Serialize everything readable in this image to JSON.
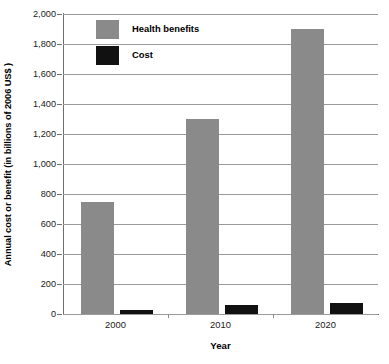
{
  "chart_data": {
    "type": "bar",
    "title": "",
    "xlabel": "Year",
    "ylabel": "Annual cost or benefit (in billions of 2006 US$ )",
    "categories": [
      "2000",
      "2010",
      "2020"
    ],
    "series": [
      {
        "name": "Health benefits",
        "color": "#8a8a8a",
        "values": [
          750,
          1300,
          1900
        ]
      },
      {
        "name": "Cost",
        "color": "#111111",
        "values": [
          25,
          60,
          75
        ]
      }
    ],
    "ylim": [
      0,
      2000
    ],
    "ytick_values": [
      0,
      200,
      400,
      600,
      800,
      1000,
      1200,
      1400,
      1600,
      1800,
      2000
    ],
    "ytick_labels": [
      "0",
      "200",
      "400",
      "600",
      "800",
      "1,000",
      "1,200",
      "1,400",
      "1,600",
      "1,800",
      "2,000"
    ],
    "grid": "horizontal",
    "legend_position": "inside-top-left"
  }
}
